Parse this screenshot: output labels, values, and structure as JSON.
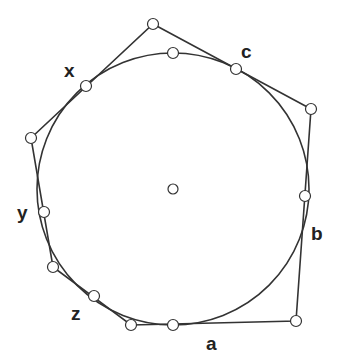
{
  "diagram": {
    "stroke_color": "#333333",
    "point_fill": "#ffffff",
    "circle": {
      "cx": 173,
      "cy": 189,
      "r": 136
    },
    "center_point": {
      "x": 173,
      "y": 189
    },
    "polygon_vertices": [
      {
        "x": 153,
        "y": 24
      },
      {
        "x": 311,
        "y": 109
      },
      {
        "x": 296,
        "y": 321
      },
      {
        "x": 131,
        "y": 325
      },
      {
        "x": 53,
        "y": 267
      },
      {
        "x": 31,
        "y": 138
      }
    ],
    "tangent_points": [
      {
        "x": 173,
        "y": 53
      },
      {
        "x": 236,
        "y": 69
      },
      {
        "x": 86,
        "y": 86
      },
      {
        "x": 305,
        "y": 196
      },
      {
        "x": 44,
        "y": 212
      },
      {
        "x": 94,
        "y": 296
      },
      {
        "x": 173,
        "y": 325
      }
    ],
    "labels": {
      "x": "x",
      "c": "c",
      "y": "y",
      "b": "b",
      "z": "z",
      "a": "a"
    }
  }
}
